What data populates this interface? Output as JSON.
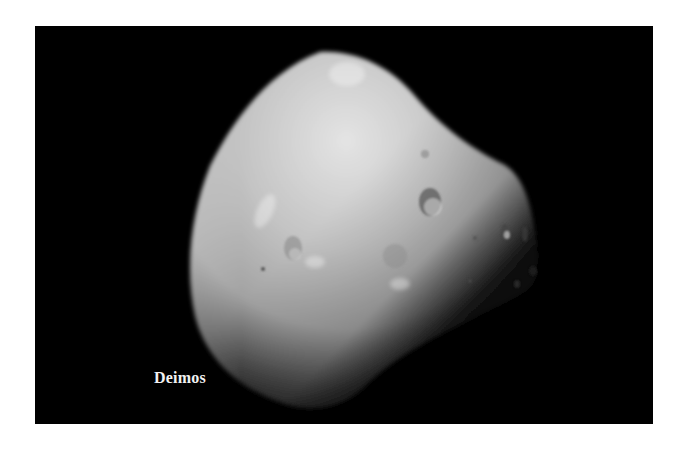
{
  "image": {
    "subject": "Deimos",
    "caption": "Deimos",
    "background_color": "#000000",
    "page_color": "#ffffff"
  }
}
